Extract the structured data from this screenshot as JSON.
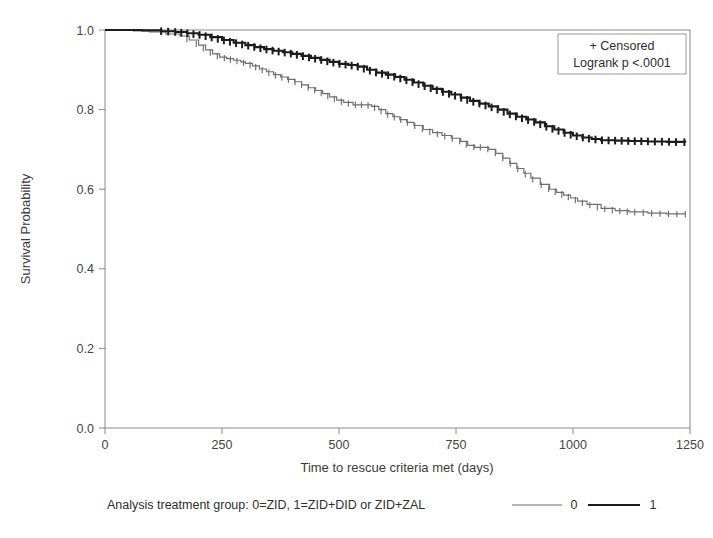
{
  "chart_data": {
    "type": "line",
    "title": "",
    "subtitle": "",
    "xlabel": "Time to rescue criteria met (days)",
    "ylabel": "Survival Probability",
    "xlim": [
      0,
      1250
    ],
    "ylim": [
      0.0,
      1.0
    ],
    "xticks": [
      0,
      250,
      500,
      750,
      1000,
      1250
    ],
    "xtick_labels": [
      "0",
      "250",
      "500",
      "750",
      "1000",
      "1250"
    ],
    "yticks": [
      0.0,
      0.2,
      0.4,
      0.6,
      0.8,
      1.0
    ],
    "ytick_labels": [
      "0.0",
      "0.2",
      "0.4",
      "0.6",
      "0.8",
      "1.0"
    ],
    "grid": false,
    "legend_position": "below-plot",
    "annotations": [
      "+ Censored",
      "Logrank p <.0001"
    ],
    "series": [
      {
        "name": "0",
        "label": "0",
        "color": "#6f6f6f",
        "linewidth": 1.15,
        "description": "Kaplan-Meier survival curve for analysis treatment group 0 = ZID",
        "x": [
          0,
          30,
          60,
          95,
          130,
          160,
          180,
          200,
          215,
          230,
          245,
          260,
          275,
          290,
          300,
          315,
          330,
          345,
          360,
          375,
          390,
          405,
          420,
          435,
          450,
          465,
          480,
          495,
          510,
          530,
          555,
          570,
          585,
          600,
          615,
          630,
          645,
          660,
          680,
          700,
          720,
          740,
          760,
          775,
          790,
          805,
          820,
          835,
          850,
          865,
          880,
          895,
          910,
          930,
          950,
          965,
          980,
          995,
          1010,
          1030,
          1060,
          1090,
          1120,
          1160,
          1200,
          1240
        ],
        "y": [
          1.0,
          1.0,
          0.998,
          0.995,
          0.99,
          0.985,
          0.975,
          0.962,
          0.95,
          0.94,
          0.932,
          0.928,
          0.924,
          0.92,
          0.916,
          0.91,
          0.902,
          0.895,
          0.888,
          0.882,
          0.876,
          0.87,
          0.862,
          0.855,
          0.848,
          0.84,
          0.832,
          0.824,
          0.818,
          0.812,
          0.812,
          0.808,
          0.8,
          0.79,
          0.782,
          0.775,
          0.768,
          0.76,
          0.75,
          0.742,
          0.735,
          0.728,
          0.72,
          0.71,
          0.705,
          0.705,
          0.7,
          0.69,
          0.678,
          0.665,
          0.652,
          0.64,
          0.628,
          0.612,
          0.6,
          0.592,
          0.585,
          0.578,
          0.57,
          0.562,
          0.552,
          0.546,
          0.543,
          0.54,
          0.538,
          0.537
        ],
        "censor_x": [
          175,
          195,
          210,
          225,
          240,
          255,
          268,
          282,
          296,
          310,
          322,
          336,
          350,
          364,
          378,
          392,
          406,
          420,
          434,
          448,
          462,
          476,
          490,
          505,
          520,
          535,
          548,
          562,
          576,
          590,
          604,
          618,
          632,
          646,
          662,
          678,
          694,
          710,
          726,
          742,
          758,
          772,
          788,
          802,
          818,
          834,
          850,
          866,
          882,
          898,
          914,
          932,
          948,
          962,
          976,
          990,
          1005,
          1020,
          1036,
          1052,
          1068,
          1084,
          1100,
          1116,
          1132,
          1150,
          1168,
          1186,
          1204,
          1222,
          1240
        ],
        "final_value": 0.537
      },
      {
        "name": "1",
        "label": "1",
        "color": "#1c1c1c",
        "linewidth": 2.1,
        "description": "Kaplan-Meier survival curve for analysis treatment group 1 = ZID+DID or ZID+ZAL",
        "x": [
          0,
          40,
          80,
          120,
          150,
          175,
          200,
          225,
          250,
          275,
          300,
          320,
          340,
          360,
          380,
          400,
          420,
          440,
          460,
          480,
          500,
          520,
          540,
          560,
          580,
          600,
          620,
          640,
          660,
          680,
          700,
          720,
          740,
          760,
          780,
          800,
          820,
          840,
          860,
          880,
          900,
          920,
          940,
          960,
          980,
          1000,
          1020,
          1040,
          1060,
          1090,
          1120,
          1160,
          1200,
          1240
        ],
        "y": [
          1.0,
          1.0,
          0.999,
          0.997,
          0.995,
          0.992,
          0.988,
          0.982,
          0.975,
          0.968,
          0.962,
          0.957,
          0.952,
          0.948,
          0.944,
          0.94,
          0.935,
          0.93,
          0.925,
          0.92,
          0.915,
          0.912,
          0.908,
          0.9,
          0.893,
          0.888,
          0.882,
          0.875,
          0.868,
          0.86,
          0.852,
          0.845,
          0.838,
          0.83,
          0.822,
          0.815,
          0.808,
          0.8,
          0.79,
          0.782,
          0.775,
          0.768,
          0.758,
          0.75,
          0.742,
          0.735,
          0.73,
          0.726,
          0.723,
          0.722,
          0.721,
          0.72,
          0.719,
          0.718
        ],
        "censor_x": [
          120,
          135,
          150,
          163,
          176,
          189,
          202,
          215,
          228,
          241,
          254,
          267,
          280,
          293,
          306,
          319,
          332,
          345,
          358,
          371,
          384,
          397,
          410,
          423,
          436,
          449,
          462,
          475,
          488,
          501,
          514,
          527,
          540,
          553,
          566,
          579,
          592,
          605,
          618,
          631,
          644,
          657,
          670,
          683,
          696,
          709,
          722,
          735,
          748,
          761,
          774,
          787,
          800,
          813,
          826,
          839,
          852,
          865,
          878,
          891,
          904,
          917,
          930,
          943,
          956,
          969,
          982,
          995,
          1008,
          1021,
          1034,
          1048,
          1062,
          1076,
          1090,
          1104,
          1118,
          1132,
          1146,
          1160,
          1175,
          1190,
          1205,
          1220,
          1238
        ],
        "final_value": 0.718
      }
    ]
  },
  "legend_box": {
    "censored_label": "+ Censored",
    "logrank_label": "Logrank p <.0001"
  },
  "bottom_legend": {
    "title": "Analysis treatment group: 0=ZID, 1=ZID+DID or ZID+ZAL",
    "entries": [
      {
        "label": "0",
        "color": "#6f6f6f"
      },
      {
        "label": "1",
        "color": "#1c1c1c"
      }
    ]
  },
  "axes": {
    "x_title": "Time to rescue criteria met (days)",
    "y_title": "Survival Probability",
    "x_tick_labels": [
      "0",
      "250",
      "500",
      "750",
      "1000",
      "1250"
    ],
    "y_tick_labels": [
      "0.0",
      "0.2",
      "0.4",
      "0.6",
      "0.8",
      "1.0"
    ]
  },
  "colors": {
    "group0": "#6f6f6f",
    "group1": "#1c1c1c",
    "axis": "#8a8a8a",
    "text": "#3a3a3a",
    "background": "#ffffff"
  }
}
